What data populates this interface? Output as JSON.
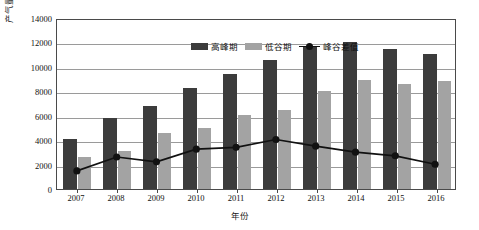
{
  "chart_data": {
    "type": "bar",
    "title": "",
    "xlabel": "年份",
    "ylabel_text": "产气量（10",
    "ylabel_sup": "4",
    "ylabel_tail": "m³/d）",
    "ylabel_full": "产气量（10⁴m³/d）",
    "categories": [
      "2007",
      "2008",
      "2009",
      "2010",
      "2011",
      "2012",
      "2013",
      "2014",
      "2015",
      "2016"
    ],
    "ylim": [
      0,
      14000
    ],
    "yticks": [
      0,
      2000,
      4000,
      6000,
      8000,
      10000,
      12000,
      14000
    ],
    "grid": true,
    "legend_position": "top-center",
    "series": [
      {
        "name": "高峰期",
        "kind": "bar",
        "color": "#3c3c3c",
        "values": [
          4100,
          5800,
          6800,
          8250,
          9450,
          10550,
          11650,
          12000,
          11500,
          11050
        ]
      },
      {
        "name": "低谷期",
        "kind": "bar",
        "color": "#a3a3a3",
        "values": [
          2600,
          3100,
          4550,
          5000,
          6050,
          6450,
          8050,
          8900,
          8600,
          8850
        ]
      },
      {
        "name": "峰谷差值",
        "kind": "line",
        "color": "#111111",
        "marker": "circle",
        "values": [
          1500,
          2650,
          2250,
          3300,
          3450,
          4100,
          3550,
          3050,
          2750,
          2050
        ]
      }
    ]
  }
}
